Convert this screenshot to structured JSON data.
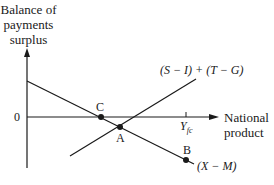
{
  "diagram": {
    "y_axis_label": [
      "Balance of",
      "payments",
      "surplus"
    ],
    "x_axis_label": [
      "National",
      "product"
    ],
    "origin_label": "0",
    "tick_label_main": "Y",
    "tick_label_sub": "fc",
    "lines": [
      {
        "name": "(S − I) + (T − G)",
        "label": "(S − I) + (T − G)",
        "slope": "upward"
      },
      {
        "name": "(X − M)",
        "label": "(X − M)",
        "slope": "downward"
      }
    ],
    "points": [
      {
        "label": "C",
        "description": "(X−M) crosses zero balance"
      },
      {
        "label": "A",
        "description": "intersection of (X−M) and (S−I)+(T−G)"
      },
      {
        "label": "B",
        "description": "(X−M) at Yfc"
      }
    ],
    "colors": {
      "ink": "#1a1a1a",
      "background": "#ffffff"
    }
  }
}
